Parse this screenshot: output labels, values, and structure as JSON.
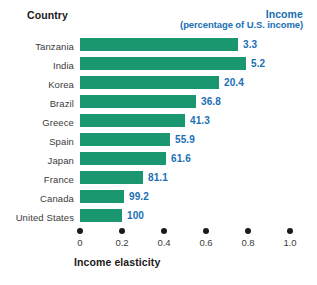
{
  "header": {
    "country_label": "Country",
    "income_label": "Income",
    "income_sublabel": "(percentage of U.S. income)"
  },
  "axis": {
    "title": "Income elasticity",
    "ticks": [
      "0",
      "0.2",
      "0.4",
      "0.6",
      "0.8",
      "1.0"
    ]
  },
  "colors": {
    "bar": "#1a9670",
    "value_text": "#1a6fb5",
    "header_text": "#1a6fb5",
    "label_text": "#3b3b3b",
    "axis_dot": "#1a1a1a",
    "background": "#ffffff"
  },
  "chart_data": {
    "type": "bar",
    "orientation": "horizontal",
    "title": "",
    "xlabel": "Income elasticity",
    "ylabel": "Country",
    "xlim": [
      0,
      1.0
    ],
    "xticks": [
      0,
      0.2,
      0.4,
      0.6,
      0.8,
      1.0
    ],
    "grid": false,
    "legend": "none",
    "categories": [
      "Tanzania",
      "India",
      "Korea",
      "Brazil",
      "Greece",
      "Spain",
      "Japan",
      "France",
      "Canada",
      "United States"
    ],
    "values": [
      0.75,
      0.79,
      0.66,
      0.55,
      0.5,
      0.43,
      0.41,
      0.3,
      0.21,
      0.2
    ],
    "data_labels": [
      "3.3",
      "5.2",
      "20.4",
      "36.8",
      "41.3",
      "55.9",
      "61.6",
      "81.1",
      "99.2",
      "100"
    ],
    "data_label_meaning": "Income (percentage of U.S. income)",
    "points": [
      {
        "country": "Tanzania",
        "income_pct_of_us": 3.3,
        "income_elasticity": 0.75
      },
      {
        "country": "India",
        "income_pct_of_us": 5.2,
        "income_elasticity": 0.79
      },
      {
        "country": "Korea",
        "income_pct_of_us": 20.4,
        "income_elasticity": 0.66
      },
      {
        "country": "Brazil",
        "income_pct_of_us": 36.8,
        "income_elasticity": 0.55
      },
      {
        "country": "Greece",
        "income_pct_of_us": 41.3,
        "income_elasticity": 0.5
      },
      {
        "country": "Spain",
        "income_pct_of_us": 55.9,
        "income_elasticity": 0.43
      },
      {
        "country": "Japan",
        "income_pct_of_us": 61.6,
        "income_elasticity": 0.41
      },
      {
        "country": "France",
        "income_pct_of_us": 81.1,
        "income_elasticity": 0.3
      },
      {
        "country": "Canada",
        "income_pct_of_us": 99.2,
        "income_elasticity": 0.21
      },
      {
        "country": "United States",
        "income_pct_of_us": 100,
        "income_elasticity": 0.2
      }
    ]
  }
}
